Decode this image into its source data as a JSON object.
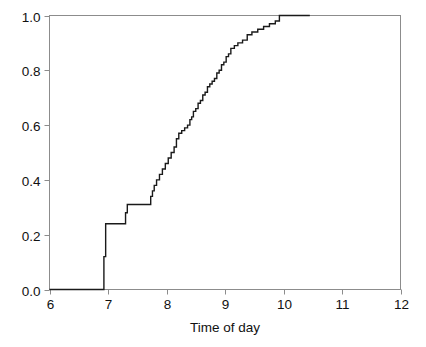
{
  "chart_data": {
    "type": "line",
    "subtype": "empirical-cdf-step",
    "title": "",
    "subtitle": "",
    "xlabel": "Time of day",
    "ylabel": "",
    "xlim": [
      6,
      12
    ],
    "ylim": [
      0.0,
      1.0
    ],
    "grid": false,
    "legend": null,
    "xticks": [
      6,
      7,
      8,
      9,
      10,
      11,
      12
    ],
    "xtick_labels": [
      "6",
      "7",
      "8",
      "9",
      "10",
      "11",
      "12"
    ],
    "yticks": [
      0.0,
      0.2,
      0.4,
      0.6,
      0.8,
      1.0
    ],
    "ytick_labels": [
      "0.0",
      "0.2",
      "0.4",
      "0.6",
      "0.8",
      "1.0"
    ],
    "line_color": "#1a1a1a",
    "axis_color": "#8c8c8c",
    "background_color": "#ffffff",
    "series": [
      {
        "name": "Cumulative proportion",
        "step": "post",
        "x": [
          6.0,
          6.93,
          6.93,
          6.96,
          7.0,
          7.27,
          7.3,
          7.33,
          7.7,
          7.73,
          7.76,
          7.79,
          7.83,
          7.88,
          7.93,
          7.98,
          8.03,
          8.08,
          8.13,
          8.17,
          8.21,
          8.26,
          8.31,
          8.36,
          8.4,
          8.43,
          8.46,
          8.5,
          8.54,
          8.58,
          8.62,
          8.66,
          8.7,
          8.74,
          8.78,
          8.82,
          8.86,
          8.9,
          8.94,
          8.98,
          9.02,
          9.06,
          9.1,
          9.16,
          9.22,
          9.3,
          9.38,
          9.46,
          9.56,
          9.66,
          9.76,
          9.86,
          9.93,
          10.45
        ],
        "y": [
          0.0,
          0.0,
          0.12,
          0.24,
          0.24,
          0.24,
          0.28,
          0.31,
          0.31,
          0.34,
          0.36,
          0.38,
          0.4,
          0.42,
          0.44,
          0.46,
          0.48,
          0.5,
          0.52,
          0.55,
          0.57,
          0.58,
          0.59,
          0.6,
          0.62,
          0.63,
          0.65,
          0.66,
          0.68,
          0.69,
          0.71,
          0.72,
          0.74,
          0.75,
          0.76,
          0.77,
          0.79,
          0.8,
          0.82,
          0.83,
          0.85,
          0.86,
          0.88,
          0.89,
          0.9,
          0.91,
          0.93,
          0.94,
          0.95,
          0.96,
          0.97,
          0.98,
          1.0,
          1.0
        ]
      }
    ]
  },
  "figure": {
    "axis_title_x": "Time of day"
  }
}
